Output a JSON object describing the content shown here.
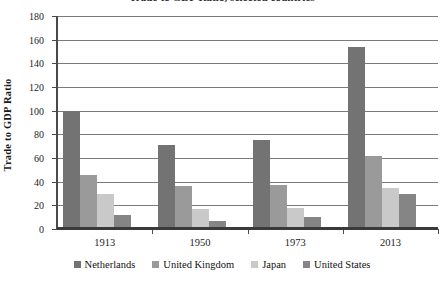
{
  "chart_data": {
    "type": "bar",
    "title": "Trade to GDP Ratio, selected countries",
    "xlabel": "",
    "ylabel": "Trade to GDP Ratio",
    "categories": [
      "1913",
      "1950",
      "1973",
      "2013"
    ],
    "ylim": [
      0,
      180
    ],
    "yticks": [
      0,
      20,
      40,
      60,
      80,
      100,
      120,
      140,
      160,
      180
    ],
    "grid": true,
    "legend_position": "bottom",
    "series": [
      {
        "name": "Netherlands",
        "color": "#737373",
        "values": [
          100,
          71,
          75,
          154
        ]
      },
      {
        "name": "United Kingdom",
        "color": "#9a9a9a",
        "values": [
          46,
          36,
          37,
          62
        ]
      },
      {
        "name": "Japan",
        "color": "#c9c9c9",
        "values": [
          30,
          17,
          18,
          35
        ]
      },
      {
        "name": "United States",
        "color": "#858585",
        "values": [
          12,
          7,
          10,
          30
        ]
      }
    ]
  }
}
